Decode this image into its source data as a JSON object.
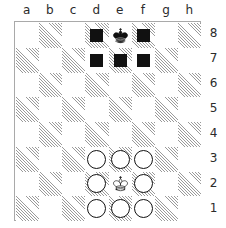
{
  "board": {
    "files": [
      "a",
      "b",
      "c",
      "d",
      "e",
      "f",
      "g",
      "h"
    ],
    "ranks": [
      "8",
      "7",
      "6",
      "5",
      "4",
      "3",
      "2",
      "1"
    ],
    "colors": {
      "light_square": "#ffffff",
      "dark_square_hatch": "#9a9a9a",
      "border": "#a9a9a9",
      "label_text": "#2b2b2b",
      "black_marker": "#111111",
      "piece_outline": "#111111"
    },
    "orientation": "white-bottom",
    "squares": [
      [
        {
          "id": "a8",
          "shade": "light",
          "piece": null,
          "marker": null
        },
        {
          "id": "b8",
          "shade": "dark",
          "piece": null,
          "marker": null
        },
        {
          "id": "c8",
          "shade": "light",
          "piece": null,
          "marker": null
        },
        {
          "id": "d8",
          "shade": "dark",
          "piece": null,
          "marker": "black-square"
        },
        {
          "id": "e8",
          "shade": "light",
          "piece": "black-king",
          "marker": null
        },
        {
          "id": "f8",
          "shade": "dark",
          "piece": null,
          "marker": "black-square"
        },
        {
          "id": "g8",
          "shade": "light",
          "piece": null,
          "marker": null
        },
        {
          "id": "h8",
          "shade": "dark",
          "piece": null,
          "marker": null
        }
      ],
      [
        {
          "id": "a7",
          "shade": "dark",
          "piece": null,
          "marker": null
        },
        {
          "id": "b7",
          "shade": "light",
          "piece": null,
          "marker": null
        },
        {
          "id": "c7",
          "shade": "dark",
          "piece": null,
          "marker": null
        },
        {
          "id": "d7",
          "shade": "light",
          "piece": null,
          "marker": "black-square"
        },
        {
          "id": "e7",
          "shade": "dark",
          "piece": null,
          "marker": "black-square"
        },
        {
          "id": "f7",
          "shade": "light",
          "piece": null,
          "marker": "black-square"
        },
        {
          "id": "g7",
          "shade": "dark",
          "piece": null,
          "marker": null
        },
        {
          "id": "h7",
          "shade": "light",
          "piece": null,
          "marker": null
        }
      ],
      [
        {
          "id": "a6",
          "shade": "light",
          "piece": null,
          "marker": null
        },
        {
          "id": "b6",
          "shade": "dark",
          "piece": null,
          "marker": null
        },
        {
          "id": "c6",
          "shade": "light",
          "piece": null,
          "marker": null
        },
        {
          "id": "d6",
          "shade": "dark",
          "piece": null,
          "marker": null
        },
        {
          "id": "e6",
          "shade": "light",
          "piece": null,
          "marker": null
        },
        {
          "id": "f6",
          "shade": "dark",
          "piece": null,
          "marker": null
        },
        {
          "id": "g6",
          "shade": "light",
          "piece": null,
          "marker": null
        },
        {
          "id": "h6",
          "shade": "dark",
          "piece": null,
          "marker": null
        }
      ],
      [
        {
          "id": "a5",
          "shade": "dark",
          "piece": null,
          "marker": null
        },
        {
          "id": "b5",
          "shade": "light",
          "piece": null,
          "marker": null
        },
        {
          "id": "c5",
          "shade": "dark",
          "piece": null,
          "marker": null
        },
        {
          "id": "d5",
          "shade": "light",
          "piece": null,
          "marker": null
        },
        {
          "id": "e5",
          "shade": "dark",
          "piece": null,
          "marker": null
        },
        {
          "id": "f5",
          "shade": "light",
          "piece": null,
          "marker": null
        },
        {
          "id": "g5",
          "shade": "dark",
          "piece": null,
          "marker": null
        },
        {
          "id": "h5",
          "shade": "light",
          "piece": null,
          "marker": null
        }
      ],
      [
        {
          "id": "a4",
          "shade": "light",
          "piece": null,
          "marker": null
        },
        {
          "id": "b4",
          "shade": "dark",
          "piece": null,
          "marker": null
        },
        {
          "id": "c4",
          "shade": "light",
          "piece": null,
          "marker": null
        },
        {
          "id": "d4",
          "shade": "dark",
          "piece": null,
          "marker": null
        },
        {
          "id": "e4",
          "shade": "light",
          "piece": null,
          "marker": null
        },
        {
          "id": "f4",
          "shade": "dark",
          "piece": null,
          "marker": null
        },
        {
          "id": "g4",
          "shade": "light",
          "piece": null,
          "marker": null
        },
        {
          "id": "h4",
          "shade": "dark",
          "piece": null,
          "marker": null
        }
      ],
      [
        {
          "id": "a3",
          "shade": "dark",
          "piece": null,
          "marker": null
        },
        {
          "id": "b3",
          "shade": "light",
          "piece": null,
          "marker": null
        },
        {
          "id": "c3",
          "shade": "dark",
          "piece": null,
          "marker": null
        },
        {
          "id": "d3",
          "shade": "light",
          "piece": null,
          "marker": "white-circle"
        },
        {
          "id": "e3",
          "shade": "dark",
          "piece": null,
          "marker": "white-circle"
        },
        {
          "id": "f3",
          "shade": "light",
          "piece": null,
          "marker": "white-circle"
        },
        {
          "id": "g3",
          "shade": "dark",
          "piece": null,
          "marker": null
        },
        {
          "id": "h3",
          "shade": "light",
          "piece": null,
          "marker": null
        }
      ],
      [
        {
          "id": "a2",
          "shade": "light",
          "piece": null,
          "marker": null
        },
        {
          "id": "b2",
          "shade": "dark",
          "piece": null,
          "marker": null
        },
        {
          "id": "c2",
          "shade": "light",
          "piece": null,
          "marker": null
        },
        {
          "id": "d2",
          "shade": "dark",
          "piece": null,
          "marker": "white-circle"
        },
        {
          "id": "e2",
          "shade": "light",
          "piece": "white-king",
          "marker": null
        },
        {
          "id": "f2",
          "shade": "dark",
          "piece": null,
          "marker": "white-circle"
        },
        {
          "id": "g2",
          "shade": "light",
          "piece": null,
          "marker": null
        },
        {
          "id": "h2",
          "shade": "dark",
          "piece": null,
          "marker": null
        }
      ],
      [
        {
          "id": "a1",
          "shade": "dark",
          "piece": null,
          "marker": null
        },
        {
          "id": "b1",
          "shade": "light",
          "piece": null,
          "marker": null
        },
        {
          "id": "c1",
          "shade": "dark",
          "piece": null,
          "marker": null
        },
        {
          "id": "d1",
          "shade": "light",
          "piece": null,
          "marker": "white-circle"
        },
        {
          "id": "e1",
          "shade": "dark",
          "piece": null,
          "marker": "white-circle"
        },
        {
          "id": "f1",
          "shade": "light",
          "piece": null,
          "marker": "white-circle"
        },
        {
          "id": "g1",
          "shade": "dark",
          "piece": null,
          "marker": null
        },
        {
          "id": "h1",
          "shade": "light",
          "piece": null,
          "marker": null
        }
      ]
    ]
  }
}
